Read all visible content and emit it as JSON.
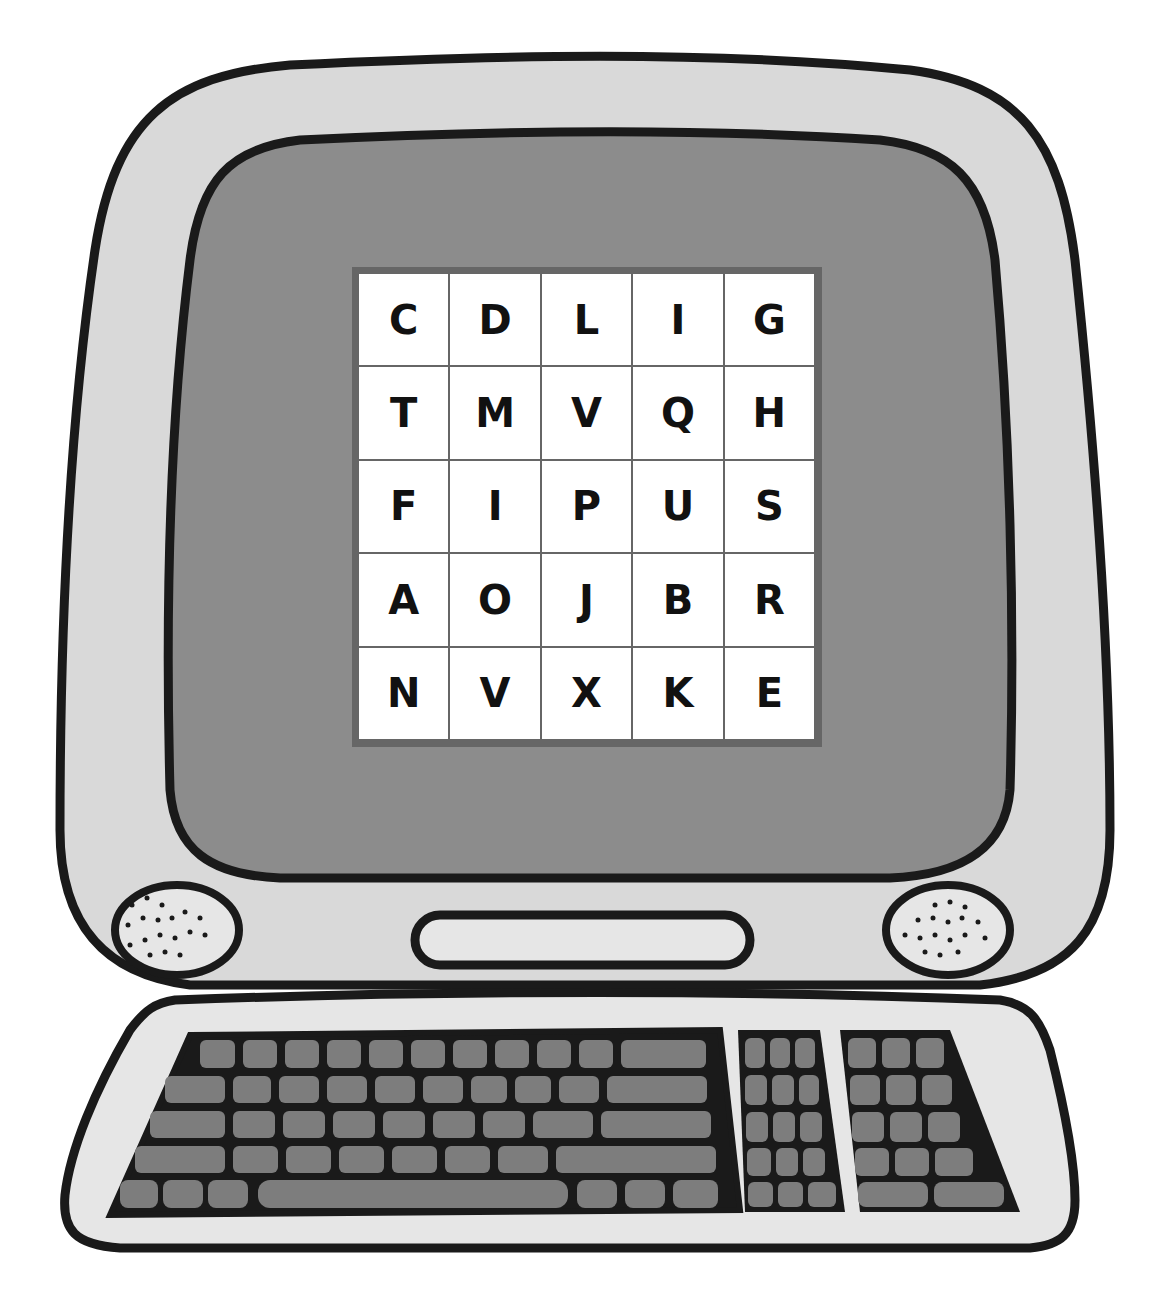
{
  "illustration": {
    "subject": "computer-monitor-with-keyboard",
    "colors": {
      "outline": "#1a1a1a",
      "bezel": "#d9d9d9",
      "screen": "#8c8c8c",
      "keys": "#7d7d7d",
      "grid_border": "#666666",
      "cell": "#ffffff"
    }
  },
  "letter_grid": {
    "rows": [
      [
        "C",
        "D",
        "L",
        "I",
        "G"
      ],
      [
        "T",
        "M",
        "V",
        "Q",
        "H"
      ],
      [
        "F",
        "I",
        "P",
        "U",
        "S"
      ],
      [
        "A",
        "O",
        "J",
        "B",
        "R"
      ],
      [
        "N",
        "V",
        "X",
        "K",
        "E"
      ]
    ]
  }
}
